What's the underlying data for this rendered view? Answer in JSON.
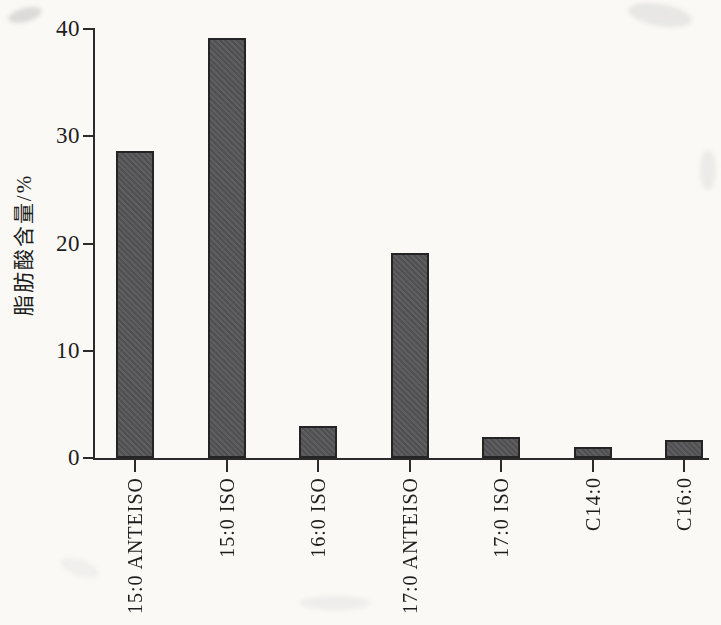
{
  "chart_data": {
    "type": "bar",
    "title": "",
    "categories": [
      "15:0 ANTEISO",
      "15:0 ISO",
      "16:0 ISO",
      "17:0 ANTEISO",
      "17:0 ISO",
      "C14:0",
      "C16:0"
    ],
    "values": [
      28.6,
      39.2,
      3.0,
      19.1,
      2.0,
      1.0,
      1.7
    ],
    "xlabel": "",
    "ylabel": "脂肪酸含量/%",
    "ylim": [
      0,
      40
    ],
    "yticks": [
      0,
      10,
      20,
      30,
      40
    ],
    "grid": false,
    "legend": null,
    "colors": {
      "bar_fill": "#59595b",
      "bar_border": "#242424",
      "axis": "#2b2b2b",
      "text": "#1d1d1d",
      "paper": "#faf9f6"
    }
  }
}
